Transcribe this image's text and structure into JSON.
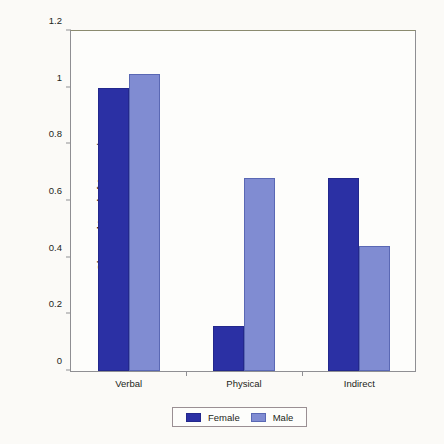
{
  "chart_data": {
    "type": "bar",
    "title": "",
    "xlabel": "",
    "ylabel": "Observed Level of Aggression",
    "categories": [
      "Verbal",
      "Physical",
      "Indirect"
    ],
    "series": [
      {
        "name": "Female",
        "color": "#2b30a4",
        "values": [
          1.0,
          0.16,
          0.68
        ]
      },
      {
        "name": "Male",
        "color": "#808cd2",
        "values": [
          1.05,
          0.68,
          0.44
        ]
      }
    ],
    "ylim": [
      0,
      1.2
    ],
    "ytick_labels": [
      "0",
      "0.2",
      "0.4",
      "0.6",
      "0.8",
      "1",
      "1.2"
    ],
    "ytick_values": [
      0,
      0.2,
      0.4,
      0.6,
      0.8,
      1.0,
      1.2
    ],
    "grid": false,
    "legend_position": "bottom"
  },
  "legend": {
    "entries": [
      {
        "label": "Female"
      },
      {
        "label": "Male"
      }
    ]
  }
}
